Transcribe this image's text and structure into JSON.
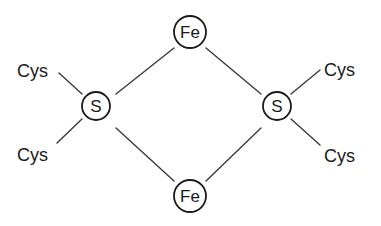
{
  "diagram": {
    "title": "",
    "type": "chemical-structure",
    "colors": {
      "line": "#3a3a3a",
      "ring": "#1a1a1a",
      "text": "#1a1a1a",
      "background": "#ffffff"
    },
    "nodes": [
      {
        "id": "fe_top",
        "label": "Fe",
        "kind": "circled-atom"
      },
      {
        "id": "s_left",
        "label": "S",
        "kind": "circled-atom"
      },
      {
        "id": "s_right",
        "label": "S",
        "kind": "circled-atom"
      },
      {
        "id": "fe_bottom",
        "label": "Fe",
        "kind": "circled-atom"
      },
      {
        "id": "cys_top_left",
        "label": "Cys",
        "kind": "ligand"
      },
      {
        "id": "cys_bottom_left",
        "label": "Cys",
        "kind": "ligand"
      },
      {
        "id": "cys_top_right",
        "label": "Cys",
        "kind": "ligand"
      },
      {
        "id": "cys_bottom_right",
        "label": "Cys",
        "kind": "ligand"
      }
    ],
    "edges": [
      {
        "from": "s_left",
        "to": "fe_top"
      },
      {
        "from": "s_left",
        "to": "fe_bottom"
      },
      {
        "from": "s_right",
        "to": "fe_top"
      },
      {
        "from": "s_right",
        "to": "fe_bottom"
      },
      {
        "from": "cys_top_left",
        "to": "s_left"
      },
      {
        "from": "cys_bottom_left",
        "to": "s_left"
      },
      {
        "from": "cys_top_right",
        "to": "s_right"
      },
      {
        "from": "cys_bottom_right",
        "to": "s_right"
      }
    ]
  }
}
